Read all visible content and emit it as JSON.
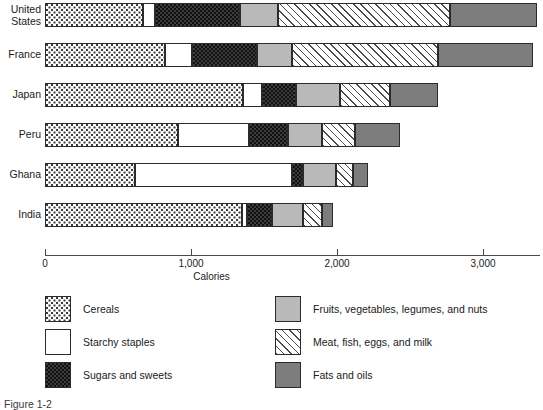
{
  "figure": {
    "caption": "Figure 1-2"
  },
  "axis": {
    "title": "Calories",
    "ticks": [
      {
        "value": 0,
        "label": "0"
      },
      {
        "value": 1000,
        "label": "1,000"
      },
      {
        "value": 2000,
        "label": "2,000"
      },
      {
        "value": 3000,
        "label": "3,000"
      }
    ],
    "min": 0,
    "max": 3400
  },
  "legend": {
    "left": [
      {
        "key": "cereals",
        "label": "Cereals",
        "pattern": "p-cereals"
      },
      {
        "key": "starchy",
        "label": "Starchy staples",
        "pattern": "p-starchy"
      },
      {
        "key": "sugars",
        "label": "Sugars and sweets",
        "pattern": "p-sugars"
      }
    ],
    "right": [
      {
        "key": "fruits",
        "label": "Fruits, vegetables, legumes, and nuts",
        "pattern": "p-fruits"
      },
      {
        "key": "meat",
        "label": "Meat, fish, eggs, and milk",
        "pattern": "p-meat"
      },
      {
        "key": "fats",
        "label": "Fats and oils",
        "pattern": "p-fats"
      }
    ]
  },
  "colors": {
    "cereals": "#ffffff",
    "starchy": "#ffffff",
    "sugars": "#3c3c3c",
    "fruits": "#b9b9b9",
    "meat": "#fdfdfd",
    "fats": "#7d7d7d",
    "outline": "#2b2b2b",
    "axis": "#4a4a4a",
    "text": "#1a1a1a",
    "background": "#ffffff"
  },
  "chart_data": {
    "type": "bar",
    "orientation": "horizontal",
    "stacked": true,
    "title": "",
    "xlabel": "Calories",
    "ylabel": "",
    "xlim": [
      0,
      3400
    ],
    "grid": false,
    "legend_position": "bottom",
    "categories": [
      "United States",
      "France",
      "Japan",
      "Peru",
      "Ghana",
      "India"
    ],
    "series": [
      {
        "name": "Cereals",
        "values": [
          670,
          820,
          1355,
          910,
          615,
          1350
        ]
      },
      {
        "name": "Starchy staples",
        "values": [
          85,
          190,
          130,
          490,
          1075,
          35
        ]
      },
      {
        "name": "Sugars and sweets",
        "values": [
          580,
          440,
          235,
          265,
          75,
          170
        ]
      },
      {
        "name": "Fruits, vegetables, legumes, and nuts",
        "values": [
          260,
          240,
          300,
          235,
          230,
          210
        ]
      },
      {
        "name": "Meat, fish, eggs, and milk",
        "values": [
          1180,
          1000,
          345,
          225,
          115,
          135
        ]
      },
      {
        "name": "Fats and oils",
        "values": [
          595,
          650,
          325,
          305,
          100,
          70
        ]
      }
    ],
    "totals": [
      3370,
      3340,
      2690,
      2430,
      2210,
      1970
    ]
  }
}
